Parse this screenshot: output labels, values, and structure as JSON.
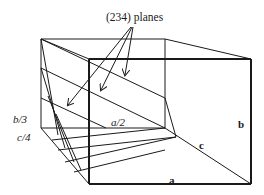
{
  "diagram": {
    "type": "crystal-lattice-planes",
    "title": "(234) planes",
    "labels": {
      "b_intercept": "b/3",
      "c_intercept": "c/4",
      "a_intercept": "a/2",
      "axis_a": "a",
      "axis_b": "b",
      "axis_c": "c"
    },
    "colors": {
      "line": "#1a1a1a",
      "background": "#ffffff"
    }
  }
}
